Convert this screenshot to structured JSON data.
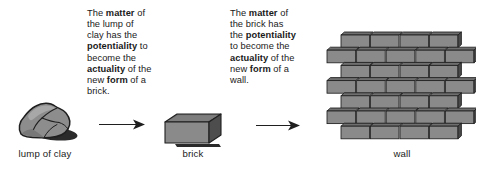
{
  "figure": {
    "background_color": "#ffffff",
    "text_color": "#1a1a1a",
    "stone_fill": "#8d8d8d",
    "stone_stroke": "#1f1f1f",
    "brick_face_fill": "#8a8a8a",
    "brick_top_fill": "#6f6f6f",
    "brick_side_fill": "#4a4a4a",
    "shadow_fill": "#2a2a2a"
  },
  "annotations": {
    "clay_to_brick": {
      "lines": [
        {
          "segments": [
            {
              "text": "The ",
              "bold": false
            },
            {
              "text": "matter",
              "bold": true
            },
            {
              "text": " of",
              "bold": false
            }
          ]
        },
        {
          "segments": [
            {
              "text": "the lump of",
              "bold": false
            }
          ]
        },
        {
          "segments": [
            {
              "text": "clay has the",
              "bold": false
            }
          ]
        },
        {
          "segments": [
            {
              "text": "potentiality",
              "bold": true
            },
            {
              "text": " to",
              "bold": false
            }
          ]
        },
        {
          "segments": [
            {
              "text": "become the",
              "bold": false
            }
          ]
        },
        {
          "segments": [
            {
              "text": "actuality",
              "bold": true
            },
            {
              "text": " of the",
              "bold": false
            }
          ]
        },
        {
          "segments": [
            {
              "text": "new ",
              "bold": false
            },
            {
              "text": "form",
              "bold": true
            },
            {
              "text": " of a",
              "bold": false
            }
          ]
        },
        {
          "segments": [
            {
              "text": "brick.",
              "bold": false
            }
          ]
        }
      ],
      "plain_text": "The matter of the lump of clay has the potentiality to become the actuality of the new form of a brick."
    },
    "brick_to_wall": {
      "lines": [
        {
          "segments": [
            {
              "text": "The ",
              "bold": false
            },
            {
              "text": "matter",
              "bold": true
            },
            {
              "text": " of",
              "bold": false
            }
          ]
        },
        {
          "segments": [
            {
              "text": "the brick has",
              "bold": false
            }
          ]
        },
        {
          "segments": [
            {
              "text": "the ",
              "bold": false
            },
            {
              "text": "potentiality",
              "bold": true
            }
          ]
        },
        {
          "segments": [
            {
              "text": "to become the",
              "bold": false
            }
          ]
        },
        {
          "segments": [
            {
              "text": "actuality",
              "bold": true
            },
            {
              "text": " of the",
              "bold": false
            }
          ]
        },
        {
          "segments": [
            {
              "text": "new ",
              "bold": false
            },
            {
              "text": "form",
              "bold": true
            },
            {
              "text": " of a",
              "bold": false
            }
          ]
        },
        {
          "segments": [
            {
              "text": "wall.",
              "bold": false
            }
          ]
        }
      ],
      "plain_text": "The matter of the brick has the potentiality to become the actuality of the new form of a wall."
    }
  },
  "objects": [
    {
      "id": "clay",
      "label": "lump of clay",
      "icon": "rock-lump-icon"
    },
    {
      "id": "brick",
      "label": "brick",
      "icon": "single-brick-icon"
    },
    {
      "id": "wall",
      "label": "wall",
      "icon": "brick-wall-icon"
    }
  ],
  "arrows": [
    {
      "id": "arrow-1",
      "from": "clay",
      "to": "brick",
      "direction": "right"
    },
    {
      "id": "arrow-2",
      "from": "brick",
      "to": "wall",
      "direction": "right"
    }
  ],
  "wall": {
    "rows": 7,
    "pattern": "running-bond",
    "bricks_per_full_row": 5,
    "bricks_per_inset_row": 4
  }
}
